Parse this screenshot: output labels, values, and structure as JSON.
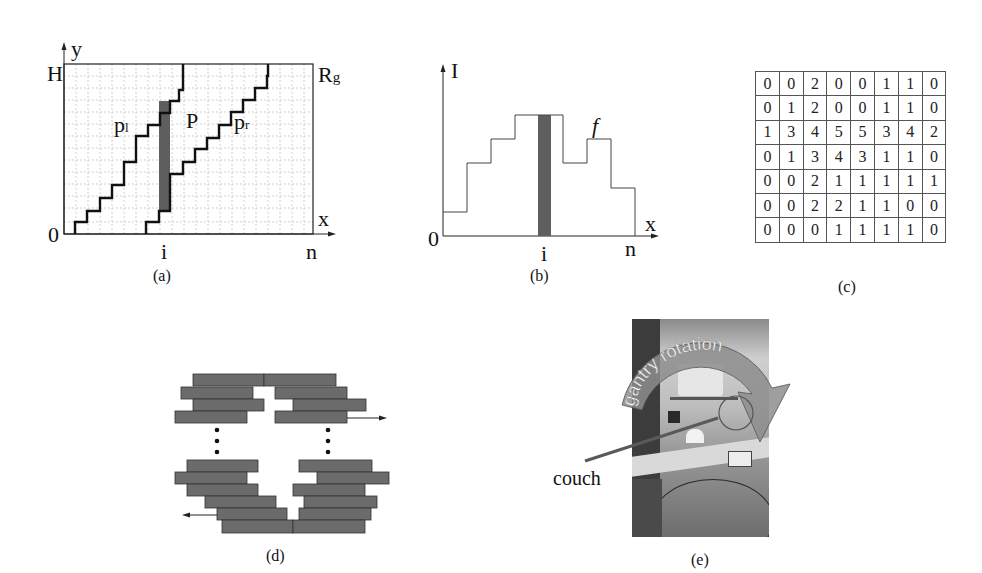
{
  "figure": {
    "panels": [
      {
        "id": "a",
        "caption": "(a)"
      },
      {
        "id": "b",
        "caption": "(b)"
      },
      {
        "id": "c",
        "caption": "(c)"
      },
      {
        "id": "d",
        "caption": "(d)"
      },
      {
        "id": "e",
        "caption": "(e)"
      }
    ]
  },
  "panel_a": {
    "axis_y_label": "y",
    "axis_x_label": "x",
    "top_left_label": "H",
    "origin_label": "0",
    "region_label": "R",
    "region_subscript": "g",
    "tick_i": "i",
    "tick_n": "n",
    "path_left_label": "p",
    "path_left_subscript": "l",
    "polygon_label": "P",
    "path_right_label": "p",
    "path_right_subscript": "r",
    "caption": "(a)"
  },
  "panel_b": {
    "axis_y_label": "I",
    "axis_x_label": "x",
    "origin_label": "0",
    "function_label": "f",
    "tick_i": "i",
    "tick_n": "n",
    "caption": "(b)",
    "step_levels": [
      1,
      3,
      4,
      5,
      5,
      3,
      4,
      2
    ]
  },
  "panel_c": {
    "caption": "(c)",
    "matrix": [
      [
        0,
        0,
        2,
        0,
        0,
        1,
        1,
        0
      ],
      [
        0,
        1,
        2,
        0,
        0,
        1,
        1,
        0
      ],
      [
        1,
        3,
        4,
        5,
        5,
        3,
        4,
        2
      ],
      [
        0,
        1,
        3,
        4,
        3,
        1,
        1,
        0
      ],
      [
        0,
        0,
        2,
        1,
        1,
        1,
        1,
        1
      ],
      [
        0,
        0,
        2,
        2,
        1,
        1,
        0,
        0
      ],
      [
        0,
        0,
        0,
        1,
        1,
        1,
        1,
        0
      ]
    ]
  },
  "panel_d": {
    "caption": "(d)",
    "ellipsis": "⋮"
  },
  "panel_e": {
    "caption": "(e)",
    "arrow_label": "gantry rotation",
    "pointer_label": "couch"
  },
  "colors": {
    "leaf_fill": "#6b6b6b",
    "bar_fill": "#5e5e5e",
    "grid": "#bdbdbd",
    "line": "#111111"
  }
}
